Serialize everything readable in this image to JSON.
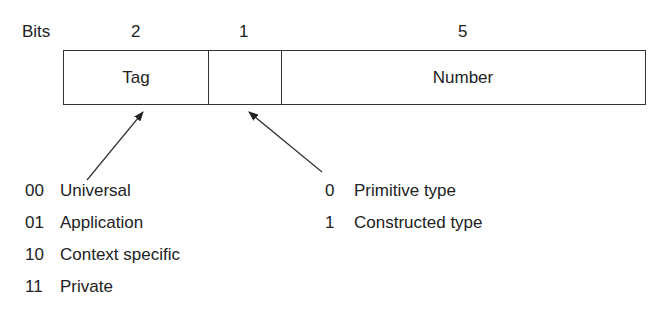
{
  "header": {
    "bits_label": "Bits",
    "bit_counts": [
      "2",
      "1",
      "5"
    ]
  },
  "fields": [
    {
      "name": "Tag",
      "bits": "2"
    },
    {
      "name": "",
      "bits": "1"
    },
    {
      "name": "Number",
      "bits": "5"
    }
  ],
  "tag_legend": [
    {
      "code": "00",
      "label": "Universal"
    },
    {
      "code": "01",
      "label": "Application"
    },
    {
      "code": "10",
      "label": "Context specific"
    },
    {
      "code": "11",
      "label": "Private"
    }
  ],
  "type_legend": [
    {
      "code": "0",
      "label": "Primitive type"
    },
    {
      "code": "1",
      "label": "Constructed type"
    }
  ],
  "colors": {
    "line": "#333333",
    "text": "#222222",
    "background": "#ffffff"
  }
}
